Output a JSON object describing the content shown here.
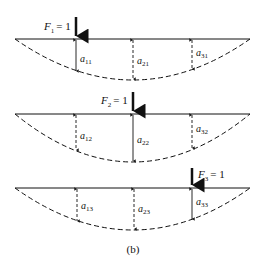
{
  "figure": {
    "caption": "(b)",
    "beams": [
      {
        "force": {
          "symbol": "F",
          "sub": "1",
          "value": "= 1"
        },
        "deflections": [
          {
            "symbol": "a",
            "sub": "11"
          },
          {
            "symbol": "a",
            "sub": "21"
          },
          {
            "symbol": "a",
            "sub": "31"
          }
        ]
      },
      {
        "force": {
          "symbol": "F",
          "sub": "2",
          "value": "= 1"
        },
        "deflections": [
          {
            "symbol": "a",
            "sub": "12"
          },
          {
            "symbol": "a",
            "sub": "22"
          },
          {
            "symbol": "a",
            "sub": "32"
          }
        ]
      },
      {
        "force": {
          "symbol": "F",
          "sub": "3",
          "value": "= 1"
        },
        "deflections": [
          {
            "symbol": "a",
            "sub": "13"
          },
          {
            "symbol": "a",
            "sub": "23"
          },
          {
            "symbol": "a",
            "sub": "33"
          }
        ]
      }
    ]
  }
}
